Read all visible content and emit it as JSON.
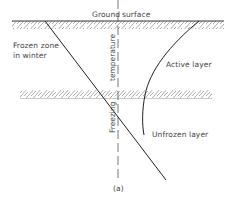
{
  "diagram": {
    "labels": {
      "ground": "Ground",
      "surface": "surface",
      "frozen_zone_line1": "Frozen zone",
      "frozen_zone_line2": "in winter",
      "active_layer": "Active layer",
      "unfrozen_layer": "Unfrozen layer",
      "freezing_temperature_top": "temperature",
      "freezing_temperature_bottom": "Freezing",
      "caption": "(a)"
    },
    "colors": {
      "line": "#222222",
      "hatch": "#9a9a9a",
      "text": "#444444"
    }
  }
}
